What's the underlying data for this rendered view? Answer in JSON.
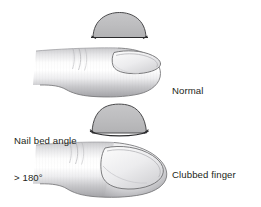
{
  "figure": {
    "background_color": "#ffffff",
    "ink_color": "#231f20",
    "outline_color": "#6e6e70",
    "nail_fill_color": "#b9b9bb",
    "skin_light_color": "#ffffff",
    "skin_shadow_color": "#a8a8ab"
  },
  "labels": {
    "normal": "Normal",
    "angle_line1": "Nail bed angle",
    "angle_line2": "> 180°",
    "clubbed_line1": "Clubbed finger",
    "clubbed_line2": "and hourglass nail"
  },
  "panels": [
    {
      "id": "normal",
      "cross_section_name": "normal-nail-cross-section",
      "cross_section_shape": "shallow-dome",
      "finger_name": "normal-finger",
      "label": "Normal"
    },
    {
      "id": "clubbed",
      "cross_section_name": "clubbed-nail-cross-section",
      "cross_section_shape": "tall-dome",
      "finger_name": "clubbed-finger",
      "label": "Clubbed finger and hourglass nail",
      "angle_note": "Nail bed angle > 180°"
    }
  ]
}
